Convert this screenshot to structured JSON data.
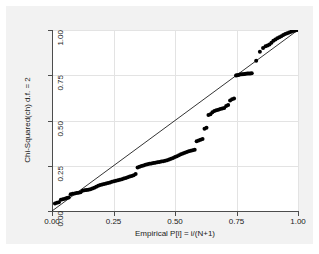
{
  "chart": {
    "type": "scatter",
    "title": "",
    "background_color": "#f2f2f2",
    "plot_background_color": "#ffffff",
    "marker_color": "#000000",
    "reference_line_color": "#000000",
    "grid_color": "#e3e3e3",
    "axis_color": "#4d4d4d"
  },
  "chart_data": {
    "type": "scatter",
    "title": "",
    "subtitle": "",
    "xlabel": "Empirical P[i] = i/(N+1)",
    "ylabel": "Chi-Squared(ch) d.f. = 2",
    "xlim": [
      0.0,
      1.0
    ],
    "ylim": [
      0.0,
      1.0
    ],
    "xticks": [
      0.0,
      0.25,
      0.5,
      0.75,
      1.0
    ],
    "yticks": [
      0.0,
      0.25,
      0.5,
      0.75,
      1.0
    ],
    "xticklabels": [
      "0.00",
      "0.25",
      "0.50",
      "0.75",
      "1.00"
    ],
    "yticklabels": [
      "0.00",
      "0.25",
      "0.50",
      "0.75",
      "1.00"
    ],
    "grid": true,
    "legend": false,
    "reference_line": {
      "label": "45-degree reference line",
      "from": [
        0.0,
        0.0
      ],
      "to": [
        1.0,
        1.0
      ]
    },
    "series": [
      {
        "name": "Q-Q points",
        "marker": "filled-circle",
        "x": [
          0.012,
          0.02,
          0.028,
          0.036,
          0.044,
          0.052,
          0.06,
          0.068,
          0.076,
          0.084,
          0.092,
          0.1,
          0.108,
          0.116,
          0.124,
          0.132,
          0.14,
          0.148,
          0.156,
          0.164,
          0.172,
          0.18,
          0.188,
          0.196,
          0.204,
          0.212,
          0.22,
          0.228,
          0.236,
          0.244,
          0.252,
          0.26,
          0.268,
          0.276,
          0.284,
          0.292,
          0.3,
          0.308,
          0.316,
          0.324,
          0.332,
          0.34,
          0.348,
          0.356,
          0.364,
          0.372,
          0.38,
          0.388,
          0.396,
          0.404,
          0.412,
          0.42,
          0.428,
          0.436,
          0.444,
          0.452,
          0.46,
          0.468,
          0.476,
          0.484,
          0.492,
          0.5,
          0.508,
          0.516,
          0.524,
          0.532,
          0.54,
          0.548,
          0.556,
          0.564,
          0.572,
          0.58,
          0.588,
          0.596,
          0.604,
          0.612,
          0.62,
          0.628,
          0.636,
          0.644,
          0.652,
          0.66,
          0.668,
          0.676,
          0.684,
          0.692,
          0.7,
          0.708,
          0.716,
          0.724,
          0.732,
          0.74,
          0.748,
          0.752,
          0.758,
          0.764,
          0.77,
          0.776,
          0.782,
          0.788,
          0.794,
          0.8,
          0.806,
          0.812,
          0.83,
          0.845,
          0.858,
          0.868,
          0.876,
          0.884,
          0.892,
          0.9,
          0.908,
          0.916,
          0.924,
          0.932,
          0.94,
          0.948,
          0.956,
          0.964,
          0.972,
          0.98,
          0.988,
          0.996
        ],
        "y": [
          0.042,
          0.045,
          0.048,
          0.062,
          0.065,
          0.068,
          0.072,
          0.075,
          0.093,
          0.095,
          0.097,
          0.099,
          0.101,
          0.103,
          0.112,
          0.114,
          0.116,
          0.118,
          0.12,
          0.124,
          0.129,
          0.134,
          0.139,
          0.143,
          0.146,
          0.149,
          0.152,
          0.155,
          0.158,
          0.161,
          0.164,
          0.167,
          0.17,
          0.173,
          0.176,
          0.179,
          0.182,
          0.186,
          0.19,
          0.194,
          0.198,
          0.205,
          0.24,
          0.244,
          0.248,
          0.252,
          0.255,
          0.258,
          0.261,
          0.263,
          0.265,
          0.267,
          0.269,
          0.271,
          0.273,
          0.275,
          0.277,
          0.28,
          0.284,
          0.288,
          0.293,
          0.298,
          0.303,
          0.308,
          0.313,
          0.318,
          0.322,
          0.326,
          0.33,
          0.333,
          0.336,
          0.339,
          0.386,
          0.39,
          0.394,
          0.398,
          0.455,
          0.46,
          0.53,
          0.535,
          0.545,
          0.552,
          0.556,
          0.56,
          0.563,
          0.566,
          0.569,
          0.58,
          0.585,
          0.61,
          0.618,
          0.622,
          0.748,
          0.75,
          0.752,
          0.754,
          0.755,
          0.756,
          0.757,
          0.758,
          0.759,
          0.76,
          0.76,
          0.761,
          0.83,
          0.88,
          0.9,
          0.91,
          0.915,
          0.92,
          0.93,
          0.94,
          0.948,
          0.954,
          0.96,
          0.966,
          0.972,
          0.978,
          0.982,
          0.986,
          0.99,
          0.994,
          0.997,
          1.0
        ]
      }
    ]
  },
  "axes": {
    "x_title": "Empirical P[i] = i/(N+1)",
    "y_title": "Chi-Squared(ch) d.f. = 2"
  }
}
